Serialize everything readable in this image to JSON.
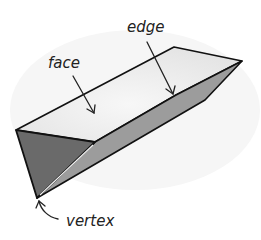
{
  "diagram": {
    "labels": {
      "face": "face",
      "edge": "edge",
      "vertex": "vertex"
    },
    "colors": {
      "top_face": "#e9e9e9",
      "front_face": "#6a6a6a",
      "side_face": "#9c9c9c",
      "outline": "#111111",
      "label": "#222222",
      "background": "#ffffff"
    }
  }
}
